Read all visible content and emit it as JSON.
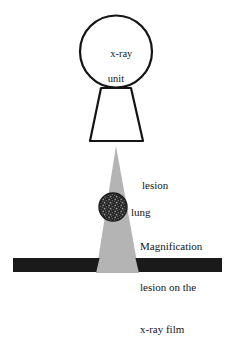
{
  "figure": {
    "type": "schematic-diagram",
    "background_color": "#ffffff"
  },
  "labels": {
    "unit_line1": "x-ray",
    "unit_line2": "unit",
    "lesion_line1": "lesion",
    "lesion_line2": "lung",
    "magnification_line1": "Magnification",
    "magnification_line2": "lesion on the",
    "magnification_line3": "x-ray film"
  },
  "shapes": {
    "source_circle": {
      "name": "x-ray-unit-circle",
      "cx": 116,
      "cy": 51.5,
      "r": 36,
      "fill": "#ffffff",
      "stroke": "#141414",
      "stroke_width": 2.2
    },
    "collimator": {
      "name": "collimator-trapezoid",
      "top_left_x": 101,
      "top_right_x": 131,
      "top_y": 88,
      "bottom_left_x": 90,
      "bottom_right_x": 143,
      "bottom_y": 141,
      "fill": "#ffffff",
      "stroke": "#141414",
      "stroke_width": 2.2
    },
    "beam": {
      "name": "x-ray-beam-cone",
      "apex_x": 116,
      "apex_y": 146,
      "base_left_x": 96,
      "base_right_x": 139,
      "base_y": 273,
      "fill": "#b4b4b4"
    },
    "lesion": {
      "name": "lesion-nodule",
      "cx": 113,
      "cy": 207,
      "r": 14,
      "fill": "#262626",
      "speckle_color": "#8c8c8c"
    },
    "film": {
      "name": "x-ray-film-bar",
      "x": 13,
      "y": 258,
      "width": 209,
      "height": 14,
      "fill": "#1a1a1a"
    }
  },
  "colors": {
    "ink": "#141414",
    "beam_gray": "#b4b4b4",
    "film_black": "#1a1a1a",
    "lesion_dark": "#262626"
  }
}
